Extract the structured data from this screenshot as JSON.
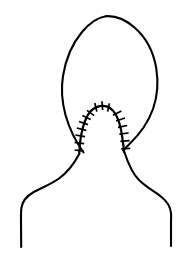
{
  "figure": {
    "view": "posterior",
    "background_color": "#ffffff",
    "stroke_color": "#000000",
    "canvas": {
      "width": 183,
      "height": 261
    },
    "style": "black-and-white line art"
  },
  "parts": {
    "head": {
      "name": "head-outline",
      "description": "large oval cranium contour, open at the base",
      "apex": {
        "x": 106,
        "y": 16
      },
      "left_extreme": {
        "x": 62,
        "y": 82
      },
      "right_extreme": {
        "x": 157,
        "y": 86
      },
      "left_base": {
        "x": 83,
        "y": 152
      },
      "right_base": {
        "x": 128,
        "y": 152
      }
    },
    "neck": {
      "name": "neck-outline",
      "description": "nape contour flaring outward into the shoulders",
      "left_start": {
        "x": 83,
        "y": 152
      },
      "right_start": {
        "x": 128,
        "y": 152
      }
    },
    "shoulders": {
      "name": "shoulder-outline",
      "description": "trapezius slope descending to vertical upper-arm lines",
      "left_arm_x": 21,
      "right_arm_x": 171,
      "arm_bottom_y": 247
    },
    "incision": {
      "name": "sutured-incision",
      "description": "inverted-U midline occipital incision closed with interrupted sutures",
      "apex": {
        "x": 102,
        "y": 106
      },
      "left_foot": {
        "x": 79,
        "y": 153
      },
      "right_foot": {
        "x": 124,
        "y": 152
      },
      "suture_count_left": 7,
      "suture_count_right": 6,
      "suture_count_apex": 3,
      "suture_total": 16,
      "suture_tick_length": 6
    }
  },
  "colors": {
    "ink": "#000000",
    "paper": "#ffffff"
  },
  "labels": {
    "figure_caption": "",
    "annotations": []
  }
}
